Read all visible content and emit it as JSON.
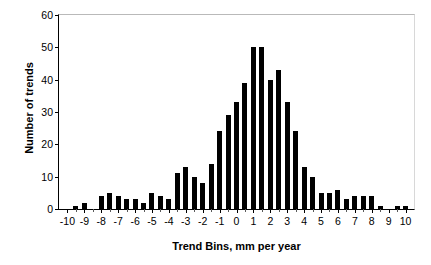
{
  "chart_data": {
    "type": "bar",
    "title": "",
    "xlabel": "Trend Bins, mm per year",
    "ylabel": "Number of trends",
    "xlim": [
      -10.5,
      10.5
    ],
    "ylim": [
      0,
      60
    ],
    "ytick_values": [
      0,
      10,
      20,
      30,
      40,
      50,
      60
    ],
    "ytick_labels": [
      "0",
      "10",
      "20",
      "30",
      "40",
      "50",
      "60"
    ],
    "xtick_values": [
      -10,
      -9,
      -8,
      -7,
      -6,
      -5,
      -4,
      -3,
      -2,
      -1,
      0,
      1,
      2,
      3,
      4,
      5,
      6,
      7,
      8,
      9,
      10
    ],
    "xtick_labels": [
      "-10",
      "-9",
      "-8",
      "-7",
      "-6",
      "-5",
      "-4",
      "-3",
      "-2",
      "-1",
      "0",
      "1",
      "2",
      "3",
      "4",
      "5",
      "6",
      "7",
      "8",
      "9",
      "10"
    ],
    "grid": false,
    "legend": false,
    "bar_color": "#000000",
    "bin_width": 0.5,
    "categories": [
      -10,
      -9.5,
      -9,
      -8.5,
      -8,
      -7.5,
      -7,
      -6.5,
      -6,
      -5.5,
      -5,
      -4.5,
      -4,
      -3.5,
      -3,
      -2.5,
      -2,
      -1.5,
      -1,
      -0.5,
      0,
      0.5,
      1,
      1.5,
      2,
      2.5,
      3,
      3.5,
      4,
      4.5,
      5,
      5.5,
      6,
      6.5,
      7,
      7.5,
      8,
      8.5,
      9,
      9.5,
      10
    ],
    "values": [
      0,
      1,
      2,
      0,
      4,
      5,
      4,
      3,
      3,
      2,
      5,
      4,
      3,
      11,
      13,
      10,
      8,
      14,
      24,
      29,
      33,
      39,
      50,
      50,
      40,
      43,
      33,
      24,
      13,
      10,
      5,
      5,
      6,
      3,
      4,
      4,
      4,
      1,
      0,
      1,
      1
    ]
  }
}
